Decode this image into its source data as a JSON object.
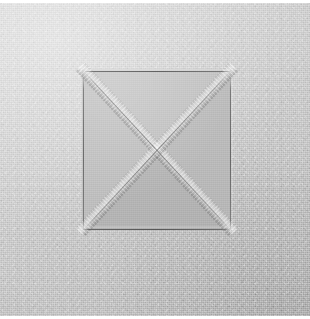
{
  "image": {
    "kind": "photograph",
    "subject": "creased square with diagonal X fold on textured paper",
    "width": 310,
    "height": 319,
    "alt_text": "Close-up photograph of a light gray textured paper sheet with a square region scored into it; two diagonal creases run corner to corner forming an X."
  },
  "surface": {
    "name": "textured-paper-sheet",
    "base_color": "#c6c6c6",
    "highlight_color": "#d2d2d2",
    "shadow_color": "#bcbcbc",
    "texture": "fine woven grain"
  },
  "crease_square": {
    "name": "folded-square-panel",
    "fill_color": "#bdbdbd",
    "edge_line_color": "#3a3a3a",
    "left": 82,
    "top": 66,
    "width": 149,
    "height": 161
  },
  "creases": [
    {
      "name": "diagonal-crease-top-left-to-bottom-right",
      "direction": "down",
      "angle_deg": 47.2,
      "band_color": "#dcdcdc",
      "score_color": "#3c3c3c"
    },
    {
      "name": "diagonal-crease-bottom-left-to-top-right",
      "direction": "up",
      "angle_deg": -47.2,
      "band_color": "#dcdcdc",
      "score_color": "#3c3c3c"
    }
  ],
  "panels": [
    {
      "name": "triangle-top",
      "tone": "light"
    },
    {
      "name": "triangle-right",
      "tone": "mid"
    },
    {
      "name": "triangle-bottom",
      "tone": "dark"
    },
    {
      "name": "triangle-left",
      "tone": "mid-light"
    }
  ],
  "margins": {
    "top_strip_color": "#ffffff",
    "bottom_strip_color": "#ffffff",
    "strip_height": 3
  }
}
